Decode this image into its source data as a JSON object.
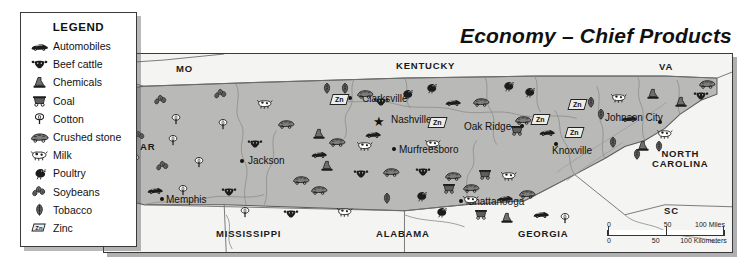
{
  "title": "Economy – Chief Products",
  "legend": {
    "heading": "LEGEND",
    "items": [
      {
        "icon": "automobile-icon",
        "label": "Automobiles"
      },
      {
        "icon": "beef-cattle-icon",
        "label": "Beef cattle"
      },
      {
        "icon": "chemicals-icon",
        "label": "Chemicals"
      },
      {
        "icon": "coal-icon",
        "label": "Coal"
      },
      {
        "icon": "cotton-icon",
        "label": "Cotton"
      },
      {
        "icon": "crushed-stone-icon",
        "label": "Crushed stone"
      },
      {
        "icon": "milk-icon",
        "label": "Milk"
      },
      {
        "icon": "poultry-icon",
        "label": "Poultry"
      },
      {
        "icon": "soybeans-icon",
        "label": "Soybeans"
      },
      {
        "icon": "tobacco-icon",
        "label": "Tobacco"
      },
      {
        "icon": "zinc-icon",
        "label": "Zinc"
      }
    ]
  },
  "map": {
    "state_labels": [
      {
        "name": "MO",
        "x": 72,
        "y": 10
      },
      {
        "name": "KENTUCKY",
        "x": 292,
        "y": 7
      },
      {
        "name": "VA",
        "x": 555,
        "y": 8
      },
      {
        "name": "AR",
        "x": 36,
        "y": 88
      },
      {
        "name": "NORTH\nCAROLINA",
        "x": 548,
        "y": 95
      },
      {
        "name": "MISSISSIPPI",
        "x": 112,
        "y": 175
      },
      {
        "name": "ALABAMA",
        "x": 272,
        "y": 175
      },
      {
        "name": "GEORGIA",
        "x": 414,
        "y": 175
      },
      {
        "name": "SC",
        "x": 560,
        "y": 152
      }
    ],
    "cities": [
      {
        "name": "Clarksville",
        "x": 246,
        "y": 44,
        "dx": 12,
        "dy": -5,
        "capital": false
      },
      {
        "name": "Nashville",
        "x": 275,
        "y": 66,
        "dx": 12,
        "dy": -6,
        "capital": true
      },
      {
        "name": "Oak Ridge",
        "x": 418,
        "y": 72,
        "dx": -58,
        "dy": -5,
        "capital": false
      },
      {
        "name": "Knoxville",
        "x": 452,
        "y": 90,
        "dx": -4,
        "dy": 1,
        "capital": false
      },
      {
        "name": "Johnson City",
        "x": 556,
        "y": 68,
        "dx": -55,
        "dy": -9,
        "capital": false
      },
      {
        "name": "Murfreesboro",
        "x": 290,
        "y": 95,
        "dx": 5,
        "dy": -5,
        "capital": false
      },
      {
        "name": "Jackson",
        "x": 138,
        "y": 107,
        "dx": 6,
        "dy": -6,
        "capital": false
      },
      {
        "name": "Memphis",
        "x": 58,
        "y": 145,
        "dx": 4,
        "dy": -5,
        "capital": false
      },
      {
        "name": "Chattanooga",
        "x": 357,
        "y": 147,
        "dx": 6,
        "dy": -5,
        "capital": false
      }
    ],
    "zinc_markers": [
      {
        "x": 227,
        "y": 40
      },
      {
        "x": 325,
        "y": 63
      },
      {
        "x": 428,
        "y": 60
      },
      {
        "x": 462,
        "y": 73
      },
      {
        "x": 465,
        "y": 45
      }
    ],
    "product_icons": [
      {
        "type": "soybeans-icon",
        "x": 48,
        "y": 38
      },
      {
        "type": "soybeans-icon",
        "x": 108,
        "y": 32
      },
      {
        "type": "milk-icon",
        "x": 152,
        "y": 42
      },
      {
        "type": "cotton-icon",
        "x": 63,
        "y": 57
      },
      {
        "type": "cotton-icon",
        "x": 110,
        "y": 62
      },
      {
        "type": "soybeans-icon",
        "x": 26,
        "y": 74
      },
      {
        "type": "cotton-icon",
        "x": 60,
        "y": 78
      },
      {
        "type": "beef-cattle-icon",
        "x": 142,
        "y": 82
      },
      {
        "type": "cotton-icon",
        "x": 22,
        "y": 97
      },
      {
        "type": "cotton-icon",
        "x": 86,
        "y": 100
      },
      {
        "type": "soybeans-icon",
        "x": 50,
        "y": 104
      },
      {
        "type": "automobile-icon",
        "x": 42,
        "y": 128
      },
      {
        "type": "cotton-icon",
        "x": 70,
        "y": 128
      },
      {
        "type": "beef-cattle-icon",
        "x": 116,
        "y": 130
      },
      {
        "type": "cotton-icon",
        "x": 132,
        "y": 150
      },
      {
        "type": "beef-cattle-icon",
        "x": 178,
        "y": 152
      },
      {
        "type": "crushed-stone-icon",
        "x": 173,
        "y": 62
      },
      {
        "type": "crushed-stone-icon",
        "x": 188,
        "y": 118
      },
      {
        "type": "chemicals-icon",
        "x": 206,
        "y": 72
      },
      {
        "type": "tobacco-icon",
        "x": 214,
        "y": 26
      },
      {
        "type": "tobacco-icon",
        "x": 232,
        "y": 26
      },
      {
        "type": "crushed-stone-icon",
        "x": 252,
        "y": 32
      },
      {
        "type": "beef-cattle-icon",
        "x": 268,
        "y": 40
      },
      {
        "type": "automobile-icon",
        "x": 340,
        "y": 40
      },
      {
        "type": "poultry-icon",
        "x": 294,
        "y": 32
      },
      {
        "type": "poultry-icon",
        "x": 318,
        "y": 26
      },
      {
        "type": "poultry-icon",
        "x": 395,
        "y": 24
      },
      {
        "type": "poultry-icon",
        "x": 416,
        "y": 30
      },
      {
        "type": "crushed-stone-icon",
        "x": 368,
        "y": 40
      },
      {
        "type": "automobile-icon",
        "x": 260,
        "y": 72
      },
      {
        "type": "crushed-stone-icon",
        "x": 224,
        "y": 80
      },
      {
        "type": "milk-icon",
        "x": 252,
        "y": 84
      },
      {
        "type": "automobile-icon",
        "x": 206,
        "y": 92
      },
      {
        "type": "milk-icon",
        "x": 320,
        "y": 82
      },
      {
        "type": "chemicals-icon",
        "x": 214,
        "y": 104
      },
      {
        "type": "beef-cattle-icon",
        "x": 248,
        "y": 112
      },
      {
        "type": "crushed-stone-icon",
        "x": 278,
        "y": 110
      },
      {
        "type": "beef-cattle-icon",
        "x": 310,
        "y": 110
      },
      {
        "type": "crushed-stone-icon",
        "x": 340,
        "y": 114
      },
      {
        "type": "crushed-stone-icon",
        "x": 206,
        "y": 128
      },
      {
        "type": "coal-icon",
        "x": 372,
        "y": 112
      },
      {
        "type": "milk-icon",
        "x": 396,
        "y": 114
      },
      {
        "type": "tobacco-icon",
        "x": 274,
        "y": 136
      },
      {
        "type": "poultry-icon",
        "x": 308,
        "y": 134
      },
      {
        "type": "milk-icon",
        "x": 232,
        "y": 150
      },
      {
        "type": "crushed-stone-icon",
        "x": 410,
        "y": 58
      },
      {
        "type": "coal-icon",
        "x": 404,
        "y": 68
      },
      {
        "type": "automobile-icon",
        "x": 434,
        "y": 70
      },
      {
        "type": "crushed-stone-icon",
        "x": 414,
        "y": 132
      },
      {
        "type": "crushed-stone-icon",
        "x": 358,
        "y": 126
      },
      {
        "type": "coal-icon",
        "x": 336,
        "y": 126
      },
      {
        "type": "milk-icon",
        "x": 358,
        "y": 138
      },
      {
        "type": "automobile-icon",
        "x": 392,
        "y": 136
      },
      {
        "type": "coal-icon",
        "x": 368,
        "y": 152
      },
      {
        "type": "chemicals-icon",
        "x": 394,
        "y": 156
      },
      {
        "type": "automobile-icon",
        "x": 428,
        "y": 152
      },
      {
        "type": "cotton-icon",
        "x": 452,
        "y": 156
      },
      {
        "type": "poultry-icon",
        "x": 328,
        "y": 150
      },
      {
        "type": "tobacco-icon",
        "x": 488,
        "y": 52
      },
      {
        "type": "tobacco-icon",
        "x": 500,
        "y": 80
      },
      {
        "type": "tobacco-icon",
        "x": 524,
        "y": 92
      },
      {
        "type": "tobacco-icon",
        "x": 478,
        "y": 40
      },
      {
        "type": "automobile-icon",
        "x": 516,
        "y": 56
      },
      {
        "type": "milk-icon",
        "x": 552,
        "y": 72
      },
      {
        "type": "milk-icon",
        "x": 506,
        "y": 36
      },
      {
        "type": "chemicals-icon",
        "x": 540,
        "y": 32
      },
      {
        "type": "chemicals-icon",
        "x": 568,
        "y": 40
      },
      {
        "type": "beef-cattle-icon",
        "x": 588,
        "y": 34
      },
      {
        "type": "crushed-stone-icon",
        "x": 594,
        "y": 22
      },
      {
        "type": "chemicals-icon",
        "x": 530,
        "y": 84
      },
      {
        "type": "tobacco-icon",
        "x": 546,
        "y": 84
      }
    ],
    "scale": {
      "miles": {
        "zero": "0",
        "mid": "50",
        "end": "100 Miles"
      },
      "kilometers": {
        "zero": "0",
        "mid": "50",
        "end": "100 Kilometers"
      }
    }
  }
}
